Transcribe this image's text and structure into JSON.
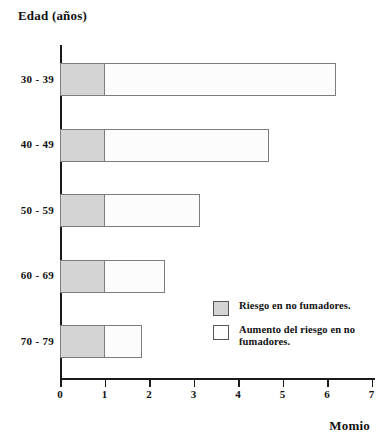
{
  "chart_data": {
    "type": "bar",
    "orientation": "horizontal",
    "stacked": true,
    "title": "",
    "ylabel": "Edad (años)",
    "xlabel": "Momio",
    "categories": [
      "30 - 39",
      "40 - 49",
      "50 - 59",
      "60 - 69",
      "70 - 79"
    ],
    "series": [
      {
        "name": "Riesgo en no fumadores.",
        "color": "#d4d4d4",
        "values": [
          1,
          1,
          1,
          1,
          1
        ]
      },
      {
        "name": "Aumento del riesgo en no fumadores.",
        "color": "#fcfcfc",
        "values": [
          5.2,
          3.7,
          2.15,
          1.35,
          0.85
        ]
      }
    ],
    "totals": [
      6.2,
      4.7,
      3.15,
      2.35,
      1.85
    ],
    "xlim": [
      0,
      7
    ],
    "xticks": [
      0,
      1,
      2,
      3,
      4,
      5,
      6,
      7
    ],
    "xtick_labels": [
      "0",
      "1",
      "2",
      "3",
      "4",
      "5",
      "6",
      "7"
    ],
    "grid": false,
    "legend_position": "inside-bottom-right"
  },
  "legend": {
    "items": [
      {
        "label": "Riesgo en no fumadores.",
        "swatch": "gray"
      },
      {
        "label": "Aumento del riesgo en no fumadores.",
        "swatch": "white"
      }
    ]
  }
}
